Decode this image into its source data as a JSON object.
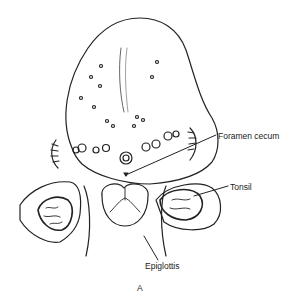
{
  "figure": {
    "panel_letter": "A",
    "labels": {
      "foramen_cecum": "Foramen cecum",
      "tonsil": "Tonsil",
      "epiglottis": "Epiglottis"
    },
    "colors": {
      "ink": "#222222",
      "background": "#ffffff",
      "shade": "#888888"
    }
  }
}
